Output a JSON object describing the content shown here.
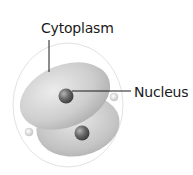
{
  "diagram": {
    "labels": [
      {
        "id": "cytoplasm",
        "text": "Cytoplasm"
      },
      {
        "id": "nucleus",
        "text": "Nucleus"
      }
    ],
    "colors": {
      "cell_fill": "#c9c9c9",
      "cell_highlight": "#e8e8e8",
      "nucleus_fill": "#6e6e6e",
      "outline": "#dcdcdc",
      "leader_line": "#1a1a1a"
    }
  }
}
